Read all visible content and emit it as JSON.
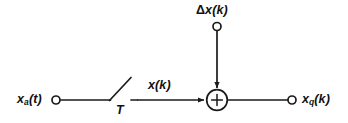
{
  "figure": {
    "kind": "signal-flow-block-diagram",
    "title": "",
    "background_color": "#ffffff",
    "line_color": "#1a1a1a",
    "text_color": "#111111"
  },
  "labels": {
    "analog_input": {
      "base": "x",
      "subscript": "a",
      "argument": "(t)",
      "full": "xa(t)"
    },
    "sampled_signal": {
      "base": "x",
      "subscript": "",
      "argument": "(k)",
      "full": "x(k)"
    },
    "sampling_period": {
      "base": "T",
      "full": "T"
    },
    "quantization_error": {
      "prefix": "Δ",
      "base": "x",
      "argument": "(k)",
      "full": "Δx(k)"
    },
    "quantized_output": {
      "base": "x",
      "subscript": "q",
      "argument": "(k)",
      "full": "xq(k)"
    },
    "summing_junction_sign": "+"
  },
  "nodes": [
    {
      "name": "input-terminal",
      "icon": "open-circle-terminal",
      "x": 56,
      "y": 100,
      "r": 4.2
    },
    {
      "name": "noise-terminal",
      "icon": "open-circle-terminal",
      "x": 217,
      "y": 26,
      "r": 4.2
    },
    {
      "name": "output-terminal",
      "icon": "open-circle-terminal",
      "x": 292,
      "y": 100,
      "r": 4.2
    },
    {
      "name": "summing-junction",
      "icon": "circle-plus",
      "x": 217,
      "y": 100,
      "r": 10.5
    }
  ],
  "edges": [
    {
      "name": "input-wire",
      "from": [
        60,
        100
      ],
      "to": [
        110,
        100
      ],
      "arrow": false
    },
    {
      "name": "switch-blade",
      "from": [
        110,
        100
      ],
      "to": [
        131,
        78
      ],
      "arrow": false
    },
    {
      "name": "switch-output-wire",
      "from": [
        133,
        100
      ],
      "to": [
        203,
        100
      ],
      "arrow": true
    },
    {
      "name": "noise-wire",
      "from": [
        217,
        31
      ],
      "to": [
        217,
        87
      ],
      "arrow": true
    },
    {
      "name": "output-wire",
      "from": [
        228,
        100
      ],
      "to": [
        288,
        100
      ],
      "arrow": false
    }
  ]
}
